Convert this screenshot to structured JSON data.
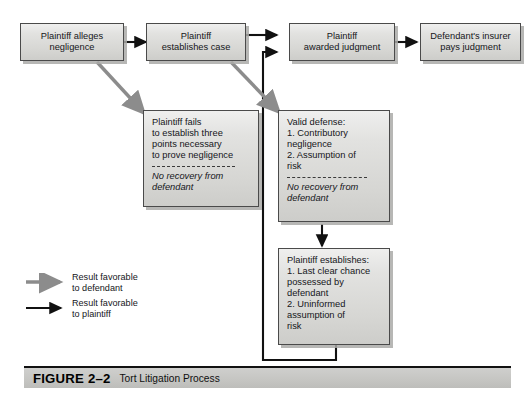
{
  "figure": {
    "number": "FIGURE 2–2",
    "title": "Tort Litigation Process"
  },
  "nodes": {
    "alleges": {
      "text": "Plaintiff alleges\nnegligence"
    },
    "establishes_case": {
      "text": "Plaintiff\nestablishes case"
    },
    "awarded": {
      "text": "Plaintiff\nawarded judgment"
    },
    "insurer_pays": {
      "text": "Defendant's insurer\npays judgment"
    },
    "fails": {
      "body": "Plaintiff fails\nto establish three\npoints necessary\nto prove negligence",
      "note": "No recovery from\ndefendant"
    },
    "valid_defense": {
      "body": "Valid defense:\n1. Contributory\n     negligence\n2. Assumption of\n     risk",
      "note": "No recovery from\ndefendant"
    },
    "plaintiff_establishes": {
      "body": "Plaintiff establishes:\n1. Last clear chance\n     possessed by\n     defendant\n2. Uninformed\n     assumption of\n     risk"
    }
  },
  "legend": {
    "favorable_defendant": "Result favorable\nto defendant",
    "favorable_plaintiff": "Result favorable\nto plaintiff"
  },
  "colors": {
    "defendant_arrow": "#8c8c8c",
    "plaintiff_arrow": "#111111",
    "box_fill": "#d9d9d6",
    "box_border": "#4a4a4a",
    "caption_bar": "#c6c6c3"
  }
}
